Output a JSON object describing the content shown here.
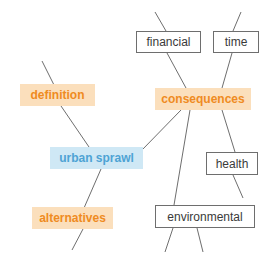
{
  "diagram": {
    "canvas": {
      "width": 274,
      "height": 265,
      "background": "#ffffff"
    },
    "colors": {
      "highlight_orange_bg": "#fbdfbc",
      "highlight_orange_text": "#ef8b22",
      "highlight_blue_bg": "#cfe8f5",
      "highlight_blue_text": "#4ea3d4",
      "box_border": "#6e6e6e",
      "box_text": "#3a3a3a",
      "edge_stroke": "#6e6e6e"
    },
    "nodes": [
      {
        "id": "financial",
        "label": "financial",
        "style": "box",
        "x": 136,
        "y": 31,
        "width": 65,
        "height": 22
      },
      {
        "id": "time",
        "label": "time",
        "style": "box",
        "x": 213,
        "y": 31,
        "width": 46,
        "height": 22
      },
      {
        "id": "definition",
        "label": "definition",
        "style": "highlight-orange",
        "x": 20,
        "y": 84,
        "width": 75,
        "height": 22
      },
      {
        "id": "consequences",
        "label": "consequences",
        "style": "highlight-orange",
        "x": 155,
        "y": 88,
        "width": 96,
        "height": 22
      },
      {
        "id": "urban-sprawl",
        "label": "urban sprawl",
        "style": "highlight-blue",
        "x": 50,
        "y": 147,
        "width": 93,
        "height": 22
      },
      {
        "id": "health",
        "label": "health",
        "style": "box",
        "x": 206,
        "y": 152,
        "width": 52,
        "height": 23
      },
      {
        "id": "alternatives",
        "label": "alternatives",
        "style": "highlight-orange",
        "x": 32,
        "y": 207,
        "width": 81,
        "height": 22
      },
      {
        "id": "environmental",
        "label": "environmental",
        "style": "box",
        "x": 155,
        "y": 205,
        "width": 100,
        "height": 23
      }
    ],
    "edges": [
      {
        "id": "edge-stub-definition-top",
        "from": "canvas-top-left",
        "to": "definition",
        "x1": 42,
        "y1": 61,
        "x2": 54,
        "y2": 85
      },
      {
        "id": "edge-definition-urban-sprawl",
        "from": "definition",
        "to": "urban-sprawl",
        "x1": 61,
        "y1": 106,
        "x2": 89,
        "y2": 147
      },
      {
        "id": "edge-urban-sprawl-alternatives",
        "from": "urban-sprawl",
        "to": "alternatives",
        "x1": 101,
        "y1": 169,
        "x2": 84,
        "y2": 208
      },
      {
        "id": "edge-stub-alternatives-bottom",
        "from": "alternatives",
        "to": "canvas-bottom-left",
        "x1": 83,
        "y1": 229,
        "x2": 72,
        "y2": 250
      },
      {
        "id": "edge-urban-sprawl-consequences",
        "from": "urban-sprawl",
        "to": "consequences",
        "x1": 142,
        "y1": 150,
        "x2": 181,
        "y2": 110
      },
      {
        "id": "edge-stub-financial-top",
        "from": "canvas-top",
        "to": "financial",
        "x1": 155,
        "y1": 12,
        "x2": 166,
        "y2": 31
      },
      {
        "id": "edge-financial-consequences",
        "from": "financial",
        "to": "consequences",
        "x1": 167,
        "y1": 53,
        "x2": 186,
        "y2": 88
      },
      {
        "id": "edge-stub-time-top",
        "from": "canvas-top",
        "to": "time",
        "x1": 241,
        "y1": 12,
        "x2": 233,
        "y2": 31
      },
      {
        "id": "edge-time-consequences",
        "from": "time",
        "to": "consequences",
        "x1": 232,
        "y1": 53,
        "x2": 222,
        "y2": 88
      },
      {
        "id": "edge-consequences-environmental",
        "from": "consequences",
        "to": "environmental",
        "x1": 190,
        "y1": 110,
        "x2": 174,
        "y2": 205
      },
      {
        "id": "edge-consequences-health",
        "from": "consequences",
        "to": "health",
        "x1": 222,
        "y1": 110,
        "x2": 235,
        "y2": 152
      },
      {
        "id": "edge-health-stub-bottom",
        "from": "health",
        "to": "canvas-bottom-right",
        "x1": 233,
        "y1": 175,
        "x2": 243,
        "y2": 198
      },
      {
        "id": "edge-stub-environmental-bottom-left",
        "from": "environmental",
        "to": "canvas-bottom",
        "x1": 173,
        "y1": 228,
        "x2": 165,
        "y2": 252
      },
      {
        "id": "edge-stub-environmental-bottom-right",
        "from": "environmental",
        "to": "canvas-bottom",
        "x1": 197,
        "y1": 228,
        "x2": 203,
        "y2": 252
      }
    ]
  }
}
